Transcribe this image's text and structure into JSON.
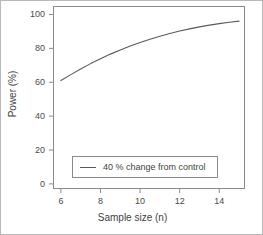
{
  "chart_data": {
    "type": "line",
    "title": "",
    "subtitle": "",
    "xlabel": "Sample size (n)",
    "ylabel": "Power (%)",
    "xlim": [
      5.6,
      15.3
    ],
    "ylim": [
      -3,
      105
    ],
    "xticks": [
      6,
      8,
      10,
      12,
      14
    ],
    "yticks": [
      0,
      20,
      40,
      60,
      80,
      100
    ],
    "xtick_labels": [
      "6",
      "8",
      "10",
      "12",
      "14"
    ],
    "ytick_labels": [
      "0",
      "20",
      "40",
      "60",
      "80",
      "100"
    ],
    "grid": false,
    "legend_position": "lower center",
    "line_color": "#5a5a5a",
    "axis_color": "#8a8a8a",
    "series": [
      {
        "name": "40 % change from control",
        "x": [
          6,
          6.5,
          7,
          7.5,
          8,
          8.5,
          9,
          9.5,
          10,
          10.5,
          11,
          11.5,
          12,
          12.5,
          13,
          13.5,
          14,
          14.5,
          15
        ],
        "values": [
          61.0,
          64.5,
          67.8,
          71.0,
          73.9,
          76.6,
          79.1,
          81.4,
          83.5,
          85.4,
          87.2,
          88.8,
          90.2,
          91.5,
          92.7,
          93.7,
          94.6,
          95.4,
          96.1
        ]
      }
    ]
  },
  "legend": {
    "entries": [
      {
        "label": "40 % change from control",
        "marker": "line-swatch"
      }
    ]
  },
  "axes": {
    "x_title": "Sample size (n)",
    "y_title": "Power (%)"
  }
}
